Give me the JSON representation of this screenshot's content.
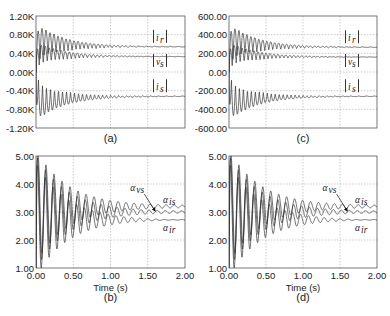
{
  "chart_data": [
    {
      "id": "a",
      "type": "line",
      "caption": "(a)",
      "title": "",
      "xlabel": "",
      "ylabel": "",
      "xlim": [
        0,
        2.0
      ],
      "ylim": [
        -1200,
        1200
      ],
      "yticks": [
        "1.20K",
        "0.80K",
        "0.40K",
        "0.00K",
        "-0.40K",
        "-0.80K",
        "-1.20K"
      ],
      "xticks_visible": false,
      "grid": true,
      "series": [
        {
          "name": "|i_r|",
          "label": "i_r",
          "steady_state": 540,
          "initial_peak": 1150,
          "behavior": "damped oscillation"
        },
        {
          "name": "|v_s|",
          "label": "v_s",
          "steady_state": 330,
          "initial_peak": 700,
          "behavior": "damped oscillation"
        },
        {
          "name": "|i_s|",
          "label": "i_s",
          "steady_state": -520,
          "initial_peak": -1150,
          "behavior": "damped oscillation"
        }
      ]
    },
    {
      "id": "c",
      "type": "line",
      "caption": "(c)",
      "title": "",
      "xlabel": "",
      "ylabel": "",
      "xlim": [
        0,
        2.0
      ],
      "ylim": [
        -600,
        600
      ],
      "yticks": [
        "600.00",
        "400.00",
        "200.00",
        "0.00",
        "-200.00",
        "-400.00",
        "-600.00"
      ],
      "xticks_visible": false,
      "grid": true,
      "series": [
        {
          "name": "|i_r|",
          "label": "i_r",
          "steady_state": 265,
          "initial_peak": 570,
          "behavior": "damped oscillation"
        },
        {
          "name": "|v_s|",
          "label": "v_s",
          "steady_state": 160,
          "initial_peak": 350,
          "behavior": "damped oscillation"
        },
        {
          "name": "|i_s|",
          "label": "i_s",
          "steady_state": -260,
          "initial_peak": -570,
          "behavior": "damped oscillation"
        }
      ]
    },
    {
      "id": "b",
      "type": "line",
      "caption": "(b)",
      "title": "",
      "xlabel": "Time (s)",
      "ylabel": "",
      "xlim": [
        0,
        2.0
      ],
      "ylim": [
        1.0,
        5.0
      ],
      "xticks": [
        "0.00",
        "0.50",
        "1.00",
        "1.50",
        "2.00"
      ],
      "yticks": [
        "5.00",
        "4.00",
        "3.00",
        "2.00",
        "1.00"
      ],
      "grid": true,
      "annotations": [
        {
          "text": "α_vs",
          "arrow_to": [
            1.6,
            3.0
          ]
        }
      ],
      "series": [
        {
          "name": "α_is",
          "label": "α_is",
          "steady_state": 3.2,
          "behavior": "damped oscillation"
        },
        {
          "name": "α_vs",
          "label": "α_vs",
          "steady_state": 3.0,
          "behavior": "damped oscillation"
        },
        {
          "name": "α_ir",
          "label": "α_ir",
          "steady_state": 2.72,
          "behavior": "damped oscillation"
        }
      ]
    },
    {
      "id": "d",
      "type": "line",
      "caption": "(d)",
      "title": "",
      "xlabel": "Time (s)",
      "ylabel": "",
      "xlim": [
        0,
        2.0
      ],
      "ylim": [
        1.0,
        5.0
      ],
      "xticks": [
        "0.00",
        "0.50",
        "1.00",
        "1.50",
        "2.00"
      ],
      "yticks": [
        "5.00",
        "4.00",
        "3.00",
        "2.00",
        "1.00"
      ],
      "grid": true,
      "annotations": [
        {
          "text": "α_vs",
          "arrow_to": [
            1.6,
            3.0
          ]
        }
      ],
      "series": [
        {
          "name": "α_is",
          "label": "α_is",
          "steady_state": 3.2,
          "behavior": "damped oscillation"
        },
        {
          "name": "α_vs",
          "label": "α_vs",
          "steady_state": 3.0,
          "behavior": "damped oscillation"
        },
        {
          "name": "α_ir",
          "label": "α_ir",
          "steady_state": 2.72,
          "behavior": "damped oscillation"
        }
      ]
    }
  ],
  "labels": {
    "a": {
      "ir": "i",
      "ir_sub": "r",
      "vs": "v",
      "vs_sub": "s",
      "is": "i",
      "is_sub": "s"
    },
    "b": {
      "avs": "α",
      "avs_sub": "vs",
      "ais": "α",
      "ais_sub": "is",
      "air": "α",
      "air_sub": "ir"
    }
  }
}
